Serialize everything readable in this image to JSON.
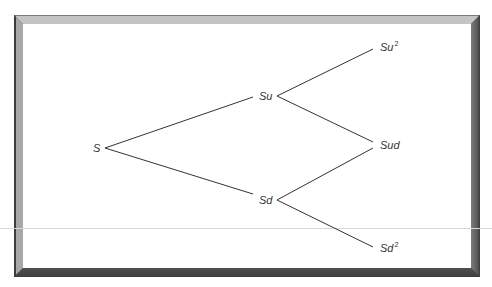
{
  "diagram": {
    "type": "binomial-tree",
    "steps": 2,
    "nodes": [
      {
        "id": "S",
        "base": "S",
        "sup": "",
        "x": 93,
        "y": 142
      },
      {
        "id": "Su",
        "base": "Su",
        "sup": "",
        "x": 259,
        "y": 91
      },
      {
        "id": "Sd",
        "base": "Sd",
        "sup": "",
        "x": 259,
        "y": 195
      },
      {
        "id": "Su2",
        "base": "Su",
        "sup": "2",
        "x": 380,
        "y": 42
      },
      {
        "id": "Sud",
        "base": "Sud",
        "sup": "",
        "x": 380,
        "y": 140
      },
      {
        "id": "Sd2",
        "base": "Sd",
        "sup": "2",
        "x": 380,
        "y": 242
      }
    ],
    "edges": [
      {
        "from": "S",
        "to": "Su"
      },
      {
        "from": "S",
        "to": "Sd"
      },
      {
        "from": "Su",
        "to": "Su2"
      },
      {
        "from": "Su",
        "to": "Sud"
      },
      {
        "from": "Sd",
        "to": "Sud"
      },
      {
        "from": "Sd",
        "to": "Sd2"
      }
    ],
    "colors": {
      "line": "#333333",
      "text": "#333333",
      "frame_dark": "#4a4a4a",
      "frame_light": "#c4c4c4",
      "background": "#ffffff"
    }
  }
}
